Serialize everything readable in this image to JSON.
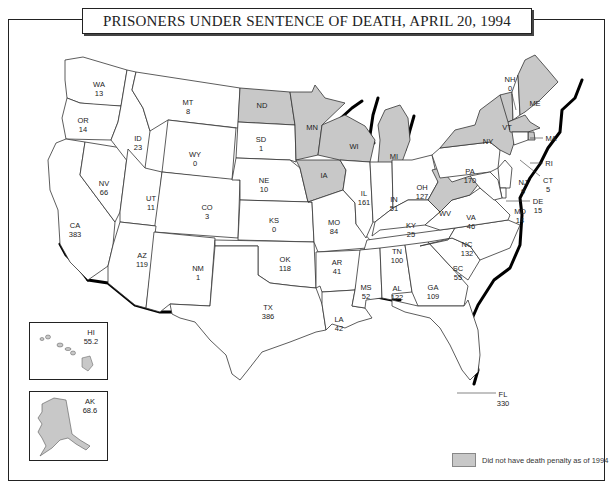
{
  "title": "PRISONERS UNDER SENTENCE OF DEATH, APRIL 20, 1994",
  "legend": {
    "label": "Did not have death penalty as of 1994",
    "swatch_color": "#c8c8c8"
  },
  "colors": {
    "death_penalty_state": "#ffffff",
    "no_death_penalty_state": "#c8c8c8",
    "border": "#333333",
    "coast_shadow": "#000000"
  },
  "states": {
    "WA": {
      "abbr": "WA",
      "value": "13"
    },
    "OR": {
      "abbr": "OR",
      "value": "14"
    },
    "CA": {
      "abbr": "CA",
      "value": "383"
    },
    "NV": {
      "abbr": "NV",
      "value": "66"
    },
    "ID": {
      "abbr": "ID",
      "value": "23"
    },
    "MT": {
      "abbr": "MT",
      "value": "8"
    },
    "WY": {
      "abbr": "WY",
      "value": "0"
    },
    "UT": {
      "abbr": "UT",
      "value": "11"
    },
    "CO": {
      "abbr": "CO",
      "value": "3"
    },
    "AZ": {
      "abbr": "AZ",
      "value": "119"
    },
    "NM": {
      "abbr": "NM",
      "value": "1"
    },
    "ND": {
      "abbr": "ND",
      "value": ""
    },
    "SD": {
      "abbr": "SD",
      "value": "1"
    },
    "NE": {
      "abbr": "NE",
      "value": "10"
    },
    "KS": {
      "abbr": "KS",
      "value": "0"
    },
    "OK": {
      "abbr": "OK",
      "value": "118"
    },
    "TX": {
      "abbr": "TX",
      "value": "386"
    },
    "MN": {
      "abbr": "MN",
      "value": ""
    },
    "IA": {
      "abbr": "IA",
      "value": ""
    },
    "MO": {
      "abbr": "MO",
      "value": "84"
    },
    "AR": {
      "abbr": "AR",
      "value": "41"
    },
    "LA": {
      "abbr": "LA",
      "value": "42"
    },
    "WI": {
      "abbr": "WI",
      "value": ""
    },
    "IL": {
      "abbr": "IL",
      "value": "161"
    },
    "MI": {
      "abbr": "MI",
      "value": ""
    },
    "IN": {
      "abbr": "IN",
      "value": "51"
    },
    "OH": {
      "abbr": "OH",
      "value": "127"
    },
    "KY": {
      "abbr": "KY",
      "value": "25"
    },
    "TN": {
      "abbr": "TN",
      "value": "100"
    },
    "MS": {
      "abbr": "MS",
      "value": "52"
    },
    "AL": {
      "abbr": "AL",
      "value": "122"
    },
    "GA": {
      "abbr": "GA",
      "value": "109"
    },
    "FL": {
      "abbr": "FL",
      "value": "330"
    },
    "SC": {
      "abbr": "SC",
      "value": "55"
    },
    "NC": {
      "abbr": "NC",
      "value": "132"
    },
    "VA": {
      "abbr": "VA",
      "value": "46"
    },
    "WV": {
      "abbr": "WV",
      "value": ""
    },
    "PA": {
      "abbr": "PA",
      "value": "170"
    },
    "NY": {
      "abbr": "NY",
      "value": ""
    },
    "VT": {
      "abbr": "VT",
      "value": ""
    },
    "NH": {
      "abbr": "NH",
      "value": "0"
    },
    "ME": {
      "abbr": "ME",
      "value": ""
    },
    "MA": {
      "abbr": "MA",
      "value": ""
    },
    "RI": {
      "abbr": "RI",
      "value": ""
    },
    "CT": {
      "abbr": "CT",
      "value": "5"
    },
    "NJ": {
      "abbr": "NJ",
      "value": "9"
    },
    "DE": {
      "abbr": "DE",
      "value": "15"
    },
    "MD": {
      "abbr": "MD",
      "value": "14"
    },
    "HI": {
      "abbr": "HI",
      "value": "55.2"
    },
    "AK": {
      "abbr": "AK",
      "value": "68.6"
    }
  },
  "no_death_penalty_states": [
    "ND",
    "MN",
    "IA",
    "WI",
    "MI",
    "WV",
    "NY",
    "VT",
    "ME",
    "MA",
    "RI",
    "HI",
    "AK"
  ]
}
